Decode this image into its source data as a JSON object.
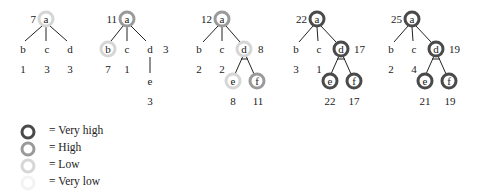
{
  "colors": {
    "very_high": "#4a4a4a",
    "high": "#9a9a9a",
    "low": "#d6d6d6",
    "very_low": "#f3f3f3",
    "edge": "#222222"
  },
  "trees": [
    {
      "root": {
        "label": "a",
        "value": "7",
        "level": "low"
      },
      "children": [
        {
          "label": "b",
          "value": "1",
          "level": "none"
        },
        {
          "label": "c",
          "value": "3",
          "level": "none"
        },
        {
          "label": "d",
          "value": "3",
          "level": "none"
        }
      ]
    },
    {
      "root": {
        "label": "a",
        "value": "11",
        "level": "high"
      },
      "children": [
        {
          "label": "b",
          "value": "7",
          "level": "low"
        },
        {
          "label": "c",
          "value": "1",
          "level": "none"
        },
        {
          "label": "d",
          "value": "3",
          "level": "none"
        }
      ],
      "grandchildren": [
        {
          "label": "e",
          "value": "3",
          "level": "none"
        }
      ]
    },
    {
      "root": {
        "label": "a",
        "value": "12",
        "level": "high"
      },
      "children": [
        {
          "label": "b",
          "value": "2",
          "level": "none"
        },
        {
          "label": "c",
          "value": "2",
          "level": "none"
        },
        {
          "label": "d",
          "value": "8",
          "level": "low"
        }
      ],
      "grandchildren": [
        {
          "label": "e",
          "value": "8",
          "level": "low"
        },
        {
          "label": "f",
          "value": "11",
          "level": "high"
        }
      ]
    },
    {
      "root": {
        "label": "a",
        "value": "22",
        "level": "very_high"
      },
      "children": [
        {
          "label": "b",
          "value": "3",
          "level": "none"
        },
        {
          "label": "c",
          "value": "1",
          "level": "none"
        },
        {
          "label": "d",
          "value": "17",
          "level": "very_high"
        }
      ],
      "grandchildren": [
        {
          "label": "e",
          "value": "22",
          "level": "very_high"
        },
        {
          "label": "f",
          "value": "17",
          "level": "very_high"
        }
      ]
    },
    {
      "root": {
        "label": "a",
        "value": "25",
        "level": "very_high"
      },
      "children": [
        {
          "label": "b",
          "value": "2",
          "level": "none"
        },
        {
          "label": "c",
          "value": "4",
          "level": "none"
        },
        {
          "label": "d",
          "value": "19",
          "level": "very_high"
        }
      ],
      "grandchildren": [
        {
          "label": "e",
          "value": "21",
          "level": "very_high"
        },
        {
          "label": "f",
          "value": "19",
          "level": "very_high"
        }
      ]
    }
  ],
  "legend": [
    {
      "level": "very_high",
      "text": "= Very high"
    },
    {
      "level": "high",
      "text": "= High"
    },
    {
      "level": "low",
      "text": "= Low"
    },
    {
      "level": "very_low",
      "text": "= Very low"
    }
  ]
}
